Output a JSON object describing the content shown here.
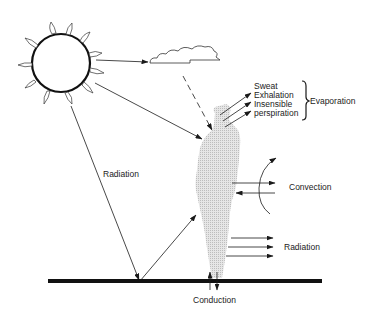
{
  "diagram": {
    "elements": {
      "sun": "sun-icon",
      "cloud": "cloud-icon",
      "body": "human-silhouette",
      "ground": "ground-line"
    },
    "labels": {
      "sweat": "Sweat",
      "exhalation": "Exhalation",
      "insensible": "Insensible",
      "perspiration": "perspiration",
      "evaporation": "Evaporation",
      "convection": "Convection",
      "radiation_body": "Radiation",
      "radiation_sun": "Radiation",
      "conduction": "Conduction"
    },
    "colors": {
      "stroke": "#1a1a1a",
      "body_fill": "#d9d9d9",
      "background": "#ffffff"
    }
  }
}
